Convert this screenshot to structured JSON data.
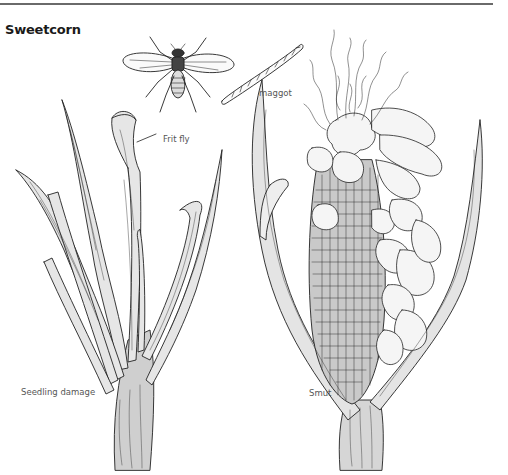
{
  "page": {
    "title": "Sweetcorn",
    "rule_color": "#6a6a6a"
  },
  "figure": {
    "labels": {
      "frit_fly": "Frit fly",
      "maggot": "maggot",
      "seedling_damage": "Seedling damage",
      "smut": "Smut"
    },
    "illustrations": [
      {
        "name": "frit-fly-adult",
        "description": "Frit fly adult, top view with wings spread"
      },
      {
        "name": "frit-fly-maggot",
        "description": "Segmented larva"
      },
      {
        "name": "seedling-damage-plant",
        "description": "Sweetcorn seedling with damaged, twisted leaves"
      },
      {
        "name": "smut-cob",
        "description": "Sweetcorn cob with smut galls and silks"
      }
    ],
    "ink_color": "#222222"
  }
}
